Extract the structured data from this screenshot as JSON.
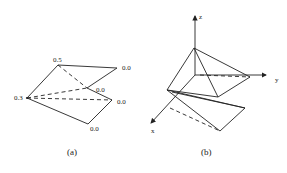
{
  "figure_a": {
    "caption": "(a)",
    "vertex_labels": {
      "top": "0.5",
      "top_right": "0.0",
      "middle": "0.0",
      "left": "0.3",
      "right": "0.0",
      "bottom": "0.0"
    }
  },
  "figure_b": {
    "caption": "(b)",
    "axes": {
      "x": "x",
      "y": "y",
      "z": "z"
    }
  },
  "colors": {
    "stroke": "#222222",
    "background": "#ffffff"
  }
}
